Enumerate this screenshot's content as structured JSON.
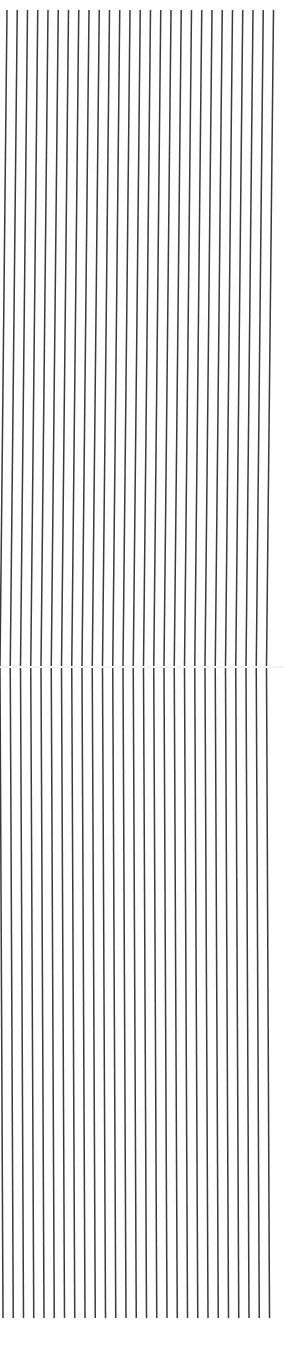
{
  "image": {
    "width": 284,
    "height": 1355,
    "background": "#ffffff"
  },
  "pattern": {
    "type": "vertical-stripes",
    "stroke_color": "#3a3a3a",
    "stroke_width": 1.5,
    "line_count": 27,
    "spacing": 10.25,
    "top_y": 10,
    "bottom_y": 1318,
    "top_first_x": 7,
    "seam_y": 666,
    "seam_first_x": 0,
    "bottom_first_x": 3
  },
  "seam": {
    "y": 666,
    "color": "#f2f2f2",
    "height": 2
  }
}
